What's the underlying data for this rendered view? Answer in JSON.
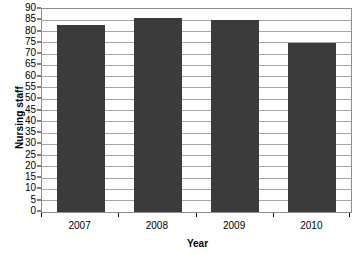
{
  "chart_data": {
    "type": "bar",
    "title": "",
    "subtitle": "",
    "xlabel": "Year",
    "ylabel": "Nursing staff",
    "categories": [
      "2007",
      "2008",
      "2009",
      "2010"
    ],
    "values": [
      83,
      86,
      85,
      75
    ],
    "series": [
      {
        "name": "Nursing staff",
        "values": [
          83,
          86,
          85,
          75
        ]
      }
    ],
    "ylim": [
      0,
      90
    ],
    "ytick_step": 5,
    "ytick_labels": [
      "0",
      "5",
      "10",
      "15",
      "20",
      "25",
      "30",
      "35",
      "40",
      "45",
      "50",
      "55",
      "60",
      "65",
      "70",
      "75",
      "80",
      "85",
      "90"
    ],
    "xtick_labels": [
      "2007",
      "2008",
      "2009",
      "2010"
    ],
    "grid": "horizontal",
    "legend": "none",
    "annotations": [],
    "colors": {
      "bar": "#3b3b3b",
      "gridline": "#a6a6a6",
      "axis": "#000000",
      "plot_border": "#8e8e8e",
      "background": "#ffffff",
      "text": "#000000"
    }
  }
}
